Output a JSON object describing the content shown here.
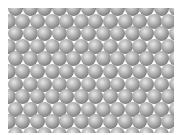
{
  "image": {
    "subject": "hexagonal close-packed lattice of gray spheres",
    "width": 180,
    "height": 135,
    "background": "#ffffff",
    "lattice": {
      "left": 8,
      "top": 8,
      "right": 174,
      "bottom": 133,
      "sphere_diameter": 15,
      "col_spacing": 14.6,
      "row_spacing": 12.6,
      "rows": 11,
      "cols": 12,
      "first_row_offset_y": -7,
      "colors": {
        "highlight": "#e6e6e6",
        "mid": "#8a8a8a",
        "edge": "#5e5e5e"
      }
    }
  }
}
